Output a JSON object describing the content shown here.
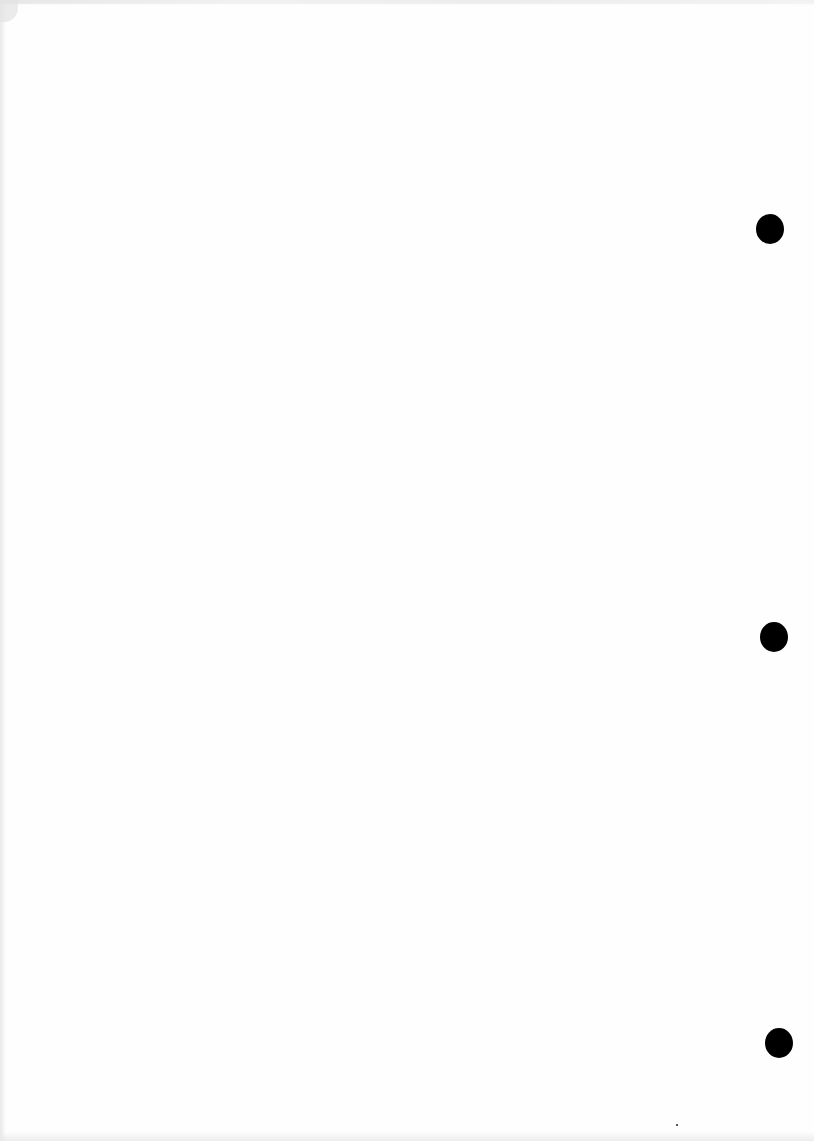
{
  "document": {
    "type": "blank-scanned-page",
    "text": "",
    "punch_holes": [
      {
        "x": 756,
        "y": 214
      },
      {
        "x": 760,
        "y": 622
      },
      {
        "x": 765,
        "y": 1028
      }
    ]
  }
}
